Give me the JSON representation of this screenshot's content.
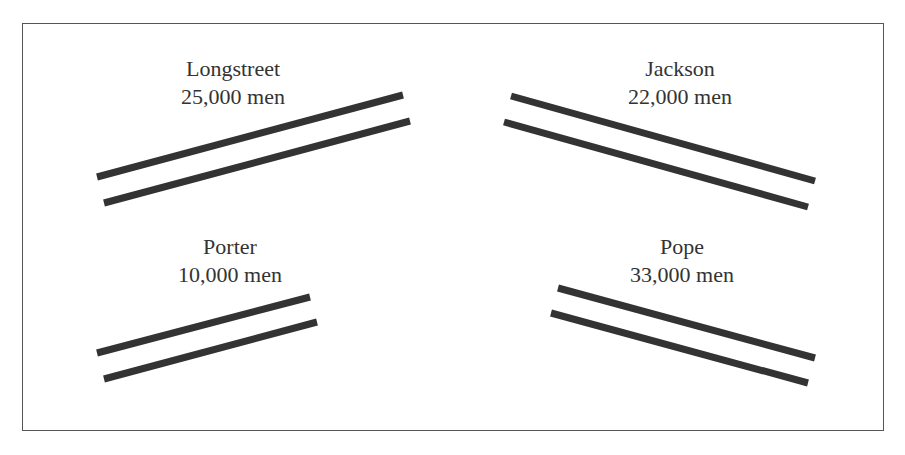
{
  "diagram": {
    "line_color": "#333333",
    "groups": [
      {
        "id": "longstreet",
        "name": "Longstreet",
        "strength": "25,000 men",
        "label_pos": [
          233,
          55
        ],
        "lines": [
          [
            97,
            177,
            403,
            95
          ],
          [
            104,
            203,
            410,
            121
          ]
        ]
      },
      {
        "id": "jackson",
        "name": "Jackson",
        "strength": "22,000 men",
        "label_pos": [
          680,
          55
        ],
        "lines": [
          [
            511,
            96,
            815,
            181
          ],
          [
            504,
            122,
            808,
            207
          ]
        ]
      },
      {
        "id": "porter",
        "name": "Porter",
        "strength": "10,000 men",
        "label_pos": [
          230,
          233
        ],
        "lines": [
          [
            97,
            353,
            310,
            297
          ],
          [
            104,
            379,
            317,
            322
          ]
        ]
      },
      {
        "id": "pope",
        "name": "Pope",
        "strength": "33,000 men",
        "label_pos": [
          682,
          233
        ],
        "lines": [
          [
            558,
            288,
            815,
            358
          ],
          [
            551,
            313,
            808,
            383
          ]
        ]
      }
    ]
  }
}
